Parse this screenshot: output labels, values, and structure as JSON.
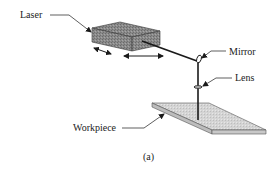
{
  "figure": {
    "caption": "(a)",
    "labels": {
      "laser": "Laser",
      "mirror": "Mirror",
      "lens": "Lens",
      "workpiece": "Workpiece"
    },
    "colors": {
      "line": "#1a1a1a",
      "box_top": "#9a9a9a",
      "box_front": "#7e7e7e",
      "box_side": "#8c8c8c",
      "plate_top": "#d2d2d2",
      "plate_edge": "#b0b0b0"
    }
  }
}
